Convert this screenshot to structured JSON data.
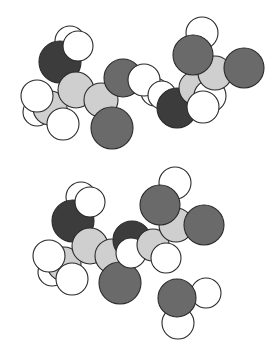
{
  "figure": {
    "type": "space-filling molecular models",
    "width": 274,
    "height": 358
  },
  "colors": {
    "H": "#ffffff",
    "C": "#cfcfcf",
    "N": "#3c3c3c",
    "O": "#6a6a6a",
    "outline": "#2a2a2a",
    "background": "#ffffff"
  },
  "molecules": [
    {
      "name": "top-molecule",
      "atoms": [
        {
          "el": "H",
          "cx": 70,
          "cy": 41,
          "r": 15
        },
        {
          "el": "N",
          "cx": 60,
          "cy": 62,
          "r": 21
        },
        {
          "el": "H",
          "cx": 78,
          "cy": 46,
          "r": 15
        },
        {
          "el": "H",
          "cx": 37,
          "cy": 112,
          "r": 14
        },
        {
          "el": "C",
          "cx": 50,
          "cy": 108,
          "r": 17
        },
        {
          "el": "H",
          "cx": 37,
          "cy": 96,
          "r": 16
        },
        {
          "el": "C",
          "cx": 76,
          "cy": 90,
          "r": 18
        },
        {
          "el": "C",
          "cx": 101,
          "cy": 100,
          "r": 17
        },
        {
          "el": "H",
          "cx": 63,
          "cy": 124,
          "r": 16
        },
        {
          "el": "O",
          "cx": 123,
          "cy": 78,
          "r": 19
        },
        {
          "el": "O",
          "cx": 112,
          "cy": 128,
          "r": 21
        },
        {
          "el": "H",
          "cx": 155,
          "cy": 92,
          "r": 14
        },
        {
          "el": "H",
          "cx": 144,
          "cy": 80,
          "r": 16
        },
        {
          "el": "H",
          "cx": 162,
          "cy": 95,
          "r": 14
        },
        {
          "el": "N",
          "cx": 177,
          "cy": 108,
          "r": 20
        },
        {
          "el": "C",
          "cx": 196,
          "cy": 88,
          "r": 17
        },
        {
          "el": "H",
          "cx": 210,
          "cy": 96,
          "r": 16
        },
        {
          "el": "H",
          "cx": 203,
          "cy": 107,
          "r": 16
        },
        {
          "el": "C",
          "cx": 215,
          "cy": 73,
          "r": 17
        },
        {
          "el": "H",
          "cx": 202,
          "cy": 33,
          "r": 16
        },
        {
          "el": "O",
          "cx": 193,
          "cy": 55,
          "r": 20
        },
        {
          "el": "O",
          "cx": 244,
          "cy": 68,
          "r": 20
        }
      ]
    },
    {
      "name": "bottom-molecule",
      "atoms": [
        {
          "el": "H",
          "cx": 81,
          "cy": 197,
          "r": 15
        },
        {
          "el": "N",
          "cx": 73,
          "cy": 221,
          "r": 21
        },
        {
          "el": "H",
          "cx": 90,
          "cy": 202,
          "r": 15
        },
        {
          "el": "H",
          "cx": 52,
          "cy": 272,
          "r": 14
        },
        {
          "el": "C",
          "cx": 64,
          "cy": 264,
          "r": 17
        },
        {
          "el": "H",
          "cx": 49,
          "cy": 256,
          "r": 16
        },
        {
          "el": "C",
          "cx": 90,
          "cy": 246,
          "r": 18
        },
        {
          "el": "C",
          "cx": 112,
          "cy": 256,
          "r": 17
        },
        {
          "el": "H",
          "cx": 72,
          "cy": 279,
          "r": 16
        },
        {
          "el": "N",
          "cx": 132,
          "cy": 240,
          "r": 19
        },
        {
          "el": "O",
          "cx": 120,
          "cy": 283,
          "r": 21
        },
        {
          "el": "H",
          "cx": 131,
          "cy": 253,
          "r": 15
        },
        {
          "el": "C",
          "cx": 153,
          "cy": 245,
          "r": 16
        },
        {
          "el": "C",
          "cx": 176,
          "cy": 225,
          "r": 17
        },
        {
          "el": "H",
          "cx": 166,
          "cy": 258,
          "r": 15
        },
        {
          "el": "H",
          "cx": 175,
          "cy": 183,
          "r": 16
        },
        {
          "el": "O",
          "cx": 160,
          "cy": 205,
          "r": 20
        },
        {
          "el": "O",
          "cx": 204,
          "cy": 225,
          "r": 20
        }
      ]
    },
    {
      "name": "water-molecule",
      "atoms": [
        {
          "el": "H",
          "cx": 206,
          "cy": 293,
          "r": 15
        },
        {
          "el": "H",
          "cx": 178,
          "cy": 323,
          "r": 16
        },
        {
          "el": "O",
          "cx": 177,
          "cy": 298,
          "r": 19
        }
      ]
    }
  ]
}
